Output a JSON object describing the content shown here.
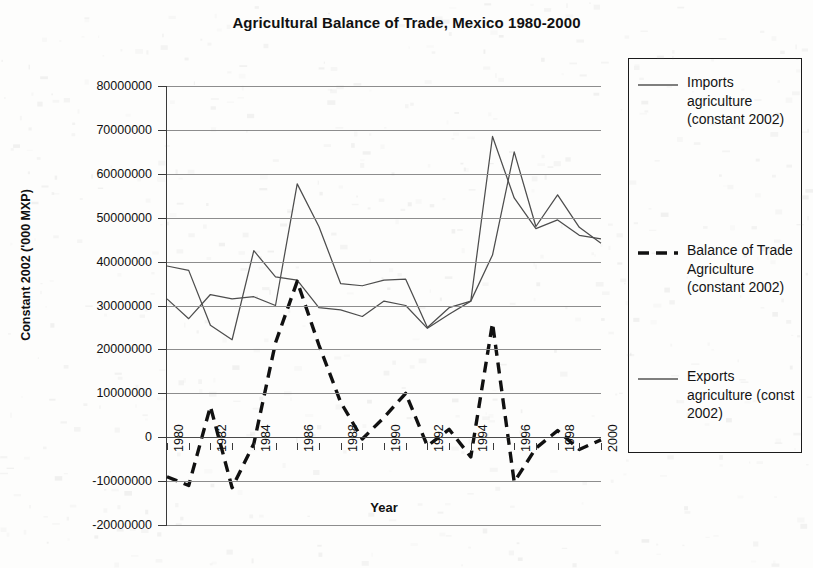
{
  "chart_data": {
    "type": "line",
    "title": "Agricultural Balance of Trade, Mexico 1980-2000",
    "xlabel": "Year",
    "ylabel": "Constant 2002 ('000 MXP)",
    "ylim": [
      -20000000,
      80000000
    ],
    "ytick_step": 10000000,
    "ytick_labels": [
      "80000000",
      "70000000",
      "60000000",
      "50000000",
      "40000000",
      "30000000",
      "20000000",
      "10000000",
      "0",
      "-10000000",
      "-20000000"
    ],
    "ytick_values": [
      80000000,
      70000000,
      60000000,
      50000000,
      40000000,
      30000000,
      20000000,
      10000000,
      0,
      -10000000,
      -20000000
    ],
    "xlim": [
      1980,
      2000
    ],
    "x": [
      1980,
      1981,
      1982,
      1983,
      1984,
      1985,
      1986,
      1987,
      1988,
      1989,
      1990,
      1991,
      1992,
      1993,
      1994,
      1995,
      1996,
      1997,
      1998,
      1999,
      2000
    ],
    "xtick_labels": [
      "1980",
      "1982",
      "1984",
      "1986",
      "1988",
      "1990",
      "1992",
      "1994",
      "1996",
      "1998",
      "2000"
    ],
    "xtick_values": [
      1980,
      1982,
      1984,
      1986,
      1988,
      1990,
      1992,
      1994,
      1996,
      1998,
      2000
    ],
    "grid": true,
    "legend_position": "right",
    "series": [
      {
        "name": "Imports agriculture (constant 2002)",
        "style": "solid",
        "color": "#4d4d4d",
        "values": [
          39000000,
          38000000,
          25500000,
          22200000,
          42500000,
          36500000,
          35800000,
          29500000,
          29000000,
          27500000,
          31000000,
          30000000,
          24800000,
          28000000,
          31000000,
          41500000,
          65000000,
          48000000,
          55200000,
          47800000,
          44200000
        ]
      },
      {
        "name": "Balance of Trade Agriculture (constant 2002)",
        "style": "dashed",
        "color": "#111111",
        "values": [
          -9000000,
          -11000000,
          7000000,
          -11500000,
          -1500000,
          21500000,
          35500000,
          21000000,
          8000000,
          -400000,
          4500000,
          10000000,
          -2000000,
          1800000,
          -4500000,
          26000000,
          -10200000,
          -2500000,
          1500000,
          -2800000,
          -600000
        ]
      },
      {
        "name": "Exports agriculture (const 2002)",
        "style": "solid",
        "color": "#4d4d4d",
        "values": [
          31500000,
          27000000,
          32500000,
          31500000,
          32000000,
          30000000,
          57700000,
          48000000,
          35000000,
          34500000,
          35800000,
          36000000,
          25000000,
          29500000,
          31000000,
          68500000,
          54500000,
          47500000,
          49500000,
          46000000,
          45200000
        ]
      }
    ]
  },
  "legend": {
    "entries": [
      {
        "label": "Imports agriculture (constant 2002)",
        "style": "solid"
      },
      {
        "label": "Balance of Trade Agriculture (constant 2002)",
        "style": "dashed"
      },
      {
        "label": "Exports agriculture (const 2002)",
        "style": "solid"
      }
    ]
  }
}
